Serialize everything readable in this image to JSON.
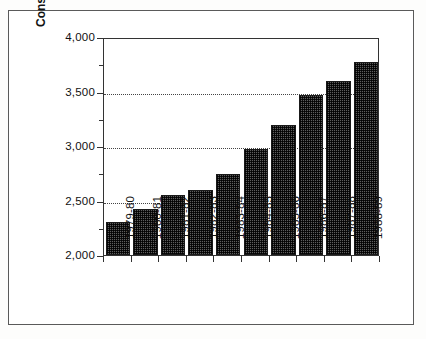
{
  "chart_data": {
    "type": "bar",
    "title": "",
    "xlabel": "",
    "ylabel": "Constant Dollars (Millions)",
    "ylim": [
      2000,
      4000
    ],
    "ytick_values": [
      2000,
      2500,
      3000,
      3500,
      4000
    ],
    "ytick_labels": [
      "2,000",
      "2,500",
      "3,000",
      "3,500",
      "4,000"
    ],
    "yminor_tick_values": [
      2250,
      2750,
      3250,
      3750
    ],
    "grid": "horizontal-dotted-at-major-ticks",
    "legend": "none",
    "bar_fill": "black-dither-pattern",
    "categories": [
      "1979-80",
      "1980-81",
      "1981-82",
      "1982-83",
      "1983-84",
      "1984-85",
      "1985-86",
      "1986-87",
      "1987-88",
      "1988-89"
    ],
    "values": [
      2300,
      2420,
      2550,
      2600,
      2740,
      2970,
      3190,
      3470,
      3600,
      3770
    ]
  },
  "style": {
    "bar_color": "#5d5d5d",
    "bar_edge_color": "#1a1a1a",
    "axis_color": "#333333",
    "grid_color": "#444444",
    "frame_color": "#5a5a5a",
    "text_color": "#111111",
    "background": "#ffffff"
  }
}
